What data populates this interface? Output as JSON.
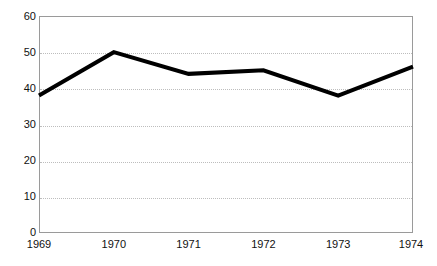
{
  "chart_data": {
    "type": "line",
    "title": "",
    "subtitle": "",
    "xlabel": "",
    "ylabel": "",
    "categories": [
      "1969",
      "1970",
      "1971",
      "1972",
      "1973",
      "1974"
    ],
    "x": [
      1969,
      1970,
      1971,
      1972,
      1973,
      1974
    ],
    "values": [
      38,
      50,
      44,
      45,
      38,
      46
    ],
    "series": [
      {
        "name": "",
        "values": [
          38,
          50,
          44,
          45,
          38,
          46
        ]
      }
    ],
    "ylim": [
      0,
      60
    ],
    "xlim": [
      1969,
      1974
    ],
    "yticks": [
      0,
      10,
      20,
      30,
      40,
      50,
      60
    ],
    "ytick_labels": [
      "0",
      "10",
      "20",
      "30",
      "40",
      "50",
      "60"
    ],
    "xtick_labels": [
      "1969",
      "1970",
      "1971",
      "1972",
      "1973",
      "1974"
    ],
    "grid": "horizontal-dotted",
    "legend": "none",
    "line_color": "#000000",
    "line_width": 4,
    "grid_color": "#bdbdbd",
    "frame_color": "#9a9a9a",
    "background_color": "#ffffff",
    "text_color": "#111111",
    "annotations": []
  }
}
